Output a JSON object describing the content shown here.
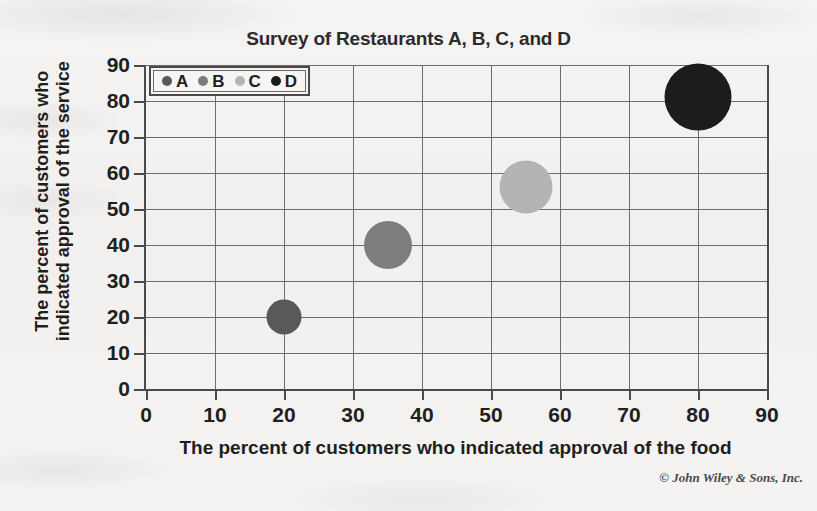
{
  "chart_data": {
    "type": "scatter",
    "title": "Survey of Restaurants A, B, C, and D",
    "xlabel": "The percent of customers who indicated approval of the food",
    "ylabel_line1": "The percent of customers who",
    "ylabel_line2": "indicated approval of the service",
    "xlim": [
      0,
      90
    ],
    "ylim": [
      0,
      90
    ],
    "xticks": [
      0,
      10,
      20,
      30,
      40,
      50,
      60,
      70,
      80,
      90
    ],
    "yticks": [
      0,
      10,
      20,
      30,
      40,
      50,
      60,
      70,
      80,
      90
    ],
    "grid": true,
    "legend_position": "top-left-inside",
    "series": [
      {
        "name": "A",
        "x": 20,
        "y": 20,
        "size": 35,
        "color": "#595959"
      },
      {
        "name": "B",
        "x": 35,
        "y": 40,
        "size": 48,
        "color": "#7d7d7d"
      },
      {
        "name": "C",
        "x": 55,
        "y": 56,
        "size": 53,
        "color": "#b4b4b4"
      },
      {
        "name": "D",
        "x": 80,
        "y": 81,
        "size": 67,
        "color": "#1c1c1c"
      }
    ]
  },
  "legend": {
    "items": [
      {
        "label": "A",
        "color": "#595959"
      },
      {
        "label": "B",
        "color": "#7d7d7d"
      },
      {
        "label": "C",
        "color": "#b4b4b4"
      },
      {
        "label": "D",
        "color": "#1c1c1c"
      }
    ]
  },
  "footer": {
    "copyright": "© John Wiley & Sons, Inc."
  },
  "colors": {
    "axis": "#4a4a4a",
    "grid": "#6d6d6d",
    "text": "#1f1f1f",
    "paper": "#f3f2f0"
  }
}
